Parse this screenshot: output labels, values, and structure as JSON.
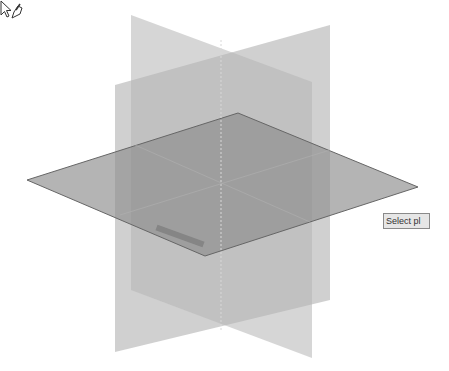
{
  "viewport": {
    "background": "#ffffff",
    "planes": [
      {
        "name": "back-vertical-plane",
        "fill": "#9a9a9a",
        "opacity": 0.55
      },
      {
        "name": "front-vertical-plane",
        "fill": "#a8a8a8",
        "opacity": 0.5
      },
      {
        "name": "horizontal-plane",
        "fill": "#7f7f7f",
        "opacity": 0.7
      }
    ]
  },
  "cursor": {
    "icon": "select-plane-cursor-icon"
  },
  "tooltip": {
    "text": "Select pl"
  }
}
